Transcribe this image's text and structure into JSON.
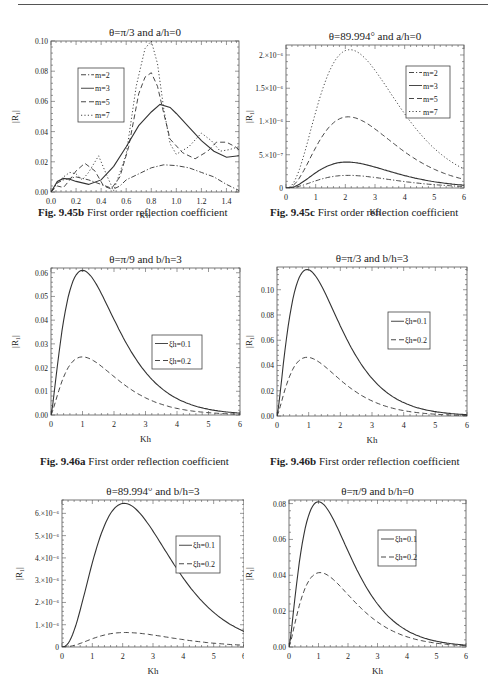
{
  "page": {
    "captions": [
      {
        "id": "9.45b",
        "bold": "Fig. 9.45b",
        "text": " First order reflection coefficient"
      },
      {
        "id": "9.45c",
        "bold": "Fig. 9.45c",
        "text": " First order reflection coefficient"
      },
      {
        "id": "9.46a",
        "bold": "Fig. 9.46a",
        "text": " First order reflection coefficient"
      },
      {
        "id": "9.46b",
        "bold": "Fig. 9.46b",
        "text": " First order reflection coefficient"
      }
    ]
  },
  "chart_data": [
    {
      "id": "fig-9-45b",
      "type": "line",
      "title": "θ=π/3 and a/h=0",
      "xlabel": "Kh",
      "ylabel": "|R₁|",
      "xlim": [
        0,
        1.5
      ],
      "ylim": [
        0,
        0.1
      ],
      "xticks": [
        0.0,
        0.2,
        0.4,
        0.6,
        0.8,
        1.0,
        1.2,
        1.4
      ],
      "xtick_labels": [
        "0.0",
        "0.2",
        "0.4",
        "0.6",
        "0.8",
        "1.0",
        "1.2",
        "1.4"
      ],
      "yticks": [
        0,
        0.02,
        0.04,
        0.06,
        0.08,
        0.1
      ],
      "ytick_labels": [
        "0.00",
        "0.02",
        "0.04",
        "0.06",
        "0.08",
        "0.10"
      ],
      "legend_position": "upper left",
      "series": [
        {
          "name": "m=2",
          "style": "dashdot",
          "x": [
            0,
            0.05,
            0.1,
            0.15,
            0.2,
            0.3,
            0.4,
            0.5,
            0.55,
            0.6,
            0.7,
            0.8,
            0.9,
            1.0,
            1.1,
            1.2,
            1.3,
            1.4,
            1.5
          ],
          "y": [
            0,
            0.006,
            0.008,
            0.009,
            0.01,
            0.008,
            0.005,
            0.002,
            0.004,
            0.008,
            0.012,
            0.016,
            0.018,
            0.0175,
            0.016,
            0.013,
            0.01,
            0.005,
            0.001
          ]
        },
        {
          "name": "m=3",
          "style": "solid",
          "x": [
            0,
            0.05,
            0.1,
            0.15,
            0.2,
            0.3,
            0.4,
            0.5,
            0.6,
            0.7,
            0.8,
            0.87,
            0.95,
            1.0,
            1.1,
            1.2,
            1.3,
            1.4,
            1.5
          ],
          "y": [
            0,
            0.007,
            0.009,
            0.0085,
            0.007,
            0.005,
            0.008,
            0.017,
            0.03,
            0.044,
            0.053,
            0.058,
            0.056,
            0.052,
            0.043,
            0.034,
            0.027,
            0.023,
            0.024
          ]
        },
        {
          "name": "m=5",
          "style": "dashed",
          "x": [
            0,
            0.05,
            0.1,
            0.15,
            0.2,
            0.27,
            0.35,
            0.42,
            0.48,
            0.55,
            0.62,
            0.7,
            0.75,
            0.8,
            0.85,
            0.9,
            0.95,
            1.05,
            1.15,
            1.25,
            1.32,
            1.4,
            1.47,
            1.5
          ],
          "y": [
            0,
            0.004,
            0.003,
            0.008,
            0.014,
            0.019,
            0.014,
            0.004,
            0.002,
            0.01,
            0.03,
            0.065,
            0.076,
            0.079,
            0.07,
            0.052,
            0.035,
            0.026,
            0.022,
            0.027,
            0.033,
            0.033,
            0.03,
            0.028
          ]
        },
        {
          "name": "m=7",
          "style": "dotted",
          "x": [
            0,
            0.05,
            0.1,
            0.15,
            0.2,
            0.25,
            0.3,
            0.38,
            0.45,
            0.5,
            0.6,
            0.68,
            0.75,
            0.8,
            0.85,
            0.9,
            0.95,
            1.0,
            1.1,
            1.2,
            1.28,
            1.35,
            1.42,
            1.5
          ],
          "y": [
            0,
            0.006,
            0.01,
            0.013,
            0.012,
            0.008,
            0.013,
            0.024,
            0.01,
            0.001,
            0.025,
            0.07,
            0.095,
            0.1,
            0.085,
            0.055,
            0.032,
            0.025,
            0.03,
            0.039,
            0.034,
            0.027,
            0.028,
            0.03
          ]
        }
      ]
    },
    {
      "id": "fig-9-45c",
      "type": "line",
      "title": "θ=89.994° and a/h=0",
      "xlabel": "Kh",
      "ylabel": "|R₁|",
      "xlim": [
        0,
        6
      ],
      "ylim": [
        0,
        2.15e-06
      ],
      "xticks": [
        0,
        1,
        2,
        3,
        4,
        5,
        6
      ],
      "xtick_labels": [
        "0",
        "1",
        "2",
        "3",
        "4",
        "5",
        "6"
      ],
      "yticks": [
        0,
        5e-07,
        1e-06,
        1.5e-06,
        2e-06
      ],
      "ytick_labels": [
        "0",
        "5.×10⁻⁷",
        "1.×10⁻⁶",
        "1.5×10⁻⁶",
        "2.×10⁻⁶"
      ],
      "legend_position": "upper right",
      "series": [
        {
          "name": "m=2",
          "style": "dashdot",
          "peak_x": 2.1,
          "peak_y": 1.9e-07
        },
        {
          "name": "m=3",
          "style": "solid",
          "peak_x": 2.05,
          "peak_y": 3.9e-07
        },
        {
          "name": "m=5",
          "style": "dashed",
          "peak_x": 2.1,
          "peak_y": 1.07e-06
        },
        {
          "name": "m=7",
          "style": "dotted",
          "peak_x": 2.15,
          "peak_y": 2.08e-06
        }
      ]
    },
    {
      "id": "fig-9-46a",
      "type": "line",
      "title": "θ=π/9 and b/h=3",
      "xlabel": "Kh",
      "ylabel": "|R₁|",
      "xlim": [
        0,
        6
      ],
      "ylim": [
        0,
        0.062
      ],
      "xticks": [
        0,
        1,
        2,
        3,
        4,
        5,
        6
      ],
      "xtick_labels": [
        "0",
        "1",
        "2",
        "3",
        "4",
        "5",
        "6"
      ],
      "yticks": [
        0,
        0.01,
        0.02,
        0.03,
        0.04,
        0.05,
        0.06
      ],
      "ytick_labels": [
        "0.00",
        "0.01",
        "0.02",
        "0.03",
        "0.04",
        "0.05",
        "0.06"
      ],
      "legend_position": "center right",
      "series": [
        {
          "name": "ξh=0.1",
          "style": "solid",
          "peak_x": 1.0,
          "peak_y": 0.061
        },
        {
          "name": "ξh=0.2",
          "style": "dashed",
          "peak_x": 1.0,
          "peak_y": 0.0245
        }
      ]
    },
    {
      "id": "fig-9-46b",
      "type": "line",
      "title": "θ=π/3 and b/h=3",
      "xlabel": "Kh",
      "ylabel": "|R₁|",
      "xlim": [
        0,
        6
      ],
      "ylim": [
        0,
        0.118
      ],
      "xticks": [
        0,
        1,
        2,
        3,
        4,
        5,
        6
      ],
      "xtick_labels": [
        "0",
        "1",
        "2",
        "3",
        "4",
        "5",
        "6"
      ],
      "yticks": [
        0,
        0.02,
        0.04,
        0.06,
        0.08,
        0.1
      ],
      "ytick_labels": [
        "0.00",
        "0.02",
        "0.04",
        "0.06",
        "0.08",
        "0.10"
      ],
      "legend_position": "upper right",
      "series": [
        {
          "name": "ξh=0.1",
          "style": "solid",
          "peak_x": 0.95,
          "peak_y": 0.116
        },
        {
          "name": "ξh=0.2",
          "style": "dashed",
          "peak_x": 0.95,
          "peak_y": 0.0465
        }
      ]
    },
    {
      "id": "fig-9-46c",
      "type": "line",
      "title": "θ=89.994° and b/h=3",
      "xlabel": "Kh",
      "ylabel": "|R₁|",
      "xlim": [
        0,
        6
      ],
      "ylim": [
        0,
        6.6e-06
      ],
      "xticks": [
        0,
        1,
        2,
        3,
        4,
        5,
        6
      ],
      "xtick_labels": [
        "0",
        "1",
        "2",
        "3",
        "4",
        "5",
        "6"
      ],
      "yticks": [
        0,
        1e-06,
        2e-06,
        3e-06,
        4e-06,
        5e-06,
        6e-06
      ],
      "ytick_labels": [
        "0",
        "1.×10⁻⁶",
        "2.×10⁻⁶",
        "3.×10⁻⁶",
        "4.×10⁻⁶",
        "5.×10⁻⁶",
        "6.×10⁻⁶"
      ],
      "legend_position": "upper right",
      "series": [
        {
          "name": "ξh=0.1",
          "style": "solid",
          "peak_x": 2.05,
          "peak_y": 6.45e-06
        },
        {
          "name": "ξh=0.2",
          "style": "dashed",
          "peak_x": 2.1,
          "peak_y": 6.5e-07
        }
      ]
    },
    {
      "id": "fig-9-46d",
      "type": "line",
      "title": "θ=π/9 and b/h=0",
      "xlabel": "Kh",
      "ylabel": "|R₁|",
      "xlim": [
        0,
        6
      ],
      "ylim": [
        0,
        0.082
      ],
      "xticks": [
        0,
        1,
        2,
        3,
        4,
        5,
        6
      ],
      "xtick_labels": [
        "0",
        "1",
        "2",
        "3",
        "4",
        "5",
        "6"
      ],
      "yticks": [
        0,
        0.02,
        0.04,
        0.06,
        0.08
      ],
      "ytick_labels": [
        "0.00",
        "0.02",
        "0.04",
        "0.06",
        "0.08"
      ],
      "legend_position": "upper right",
      "series": [
        {
          "name": "ξh=0.1",
          "style": "solid",
          "peak_x": 1.0,
          "peak_y": 0.081
        },
        {
          "name": "ξh=0.2",
          "style": "dashed",
          "peak_x": 1.05,
          "peak_y": 0.0415
        }
      ]
    }
  ],
  "layout": [
    {
      "chart": 0,
      "fig_left": 0,
      "fig_top": 8,
      "w": 244,
      "h": 210,
      "plot": [
        51,
        33,
        188,
        151
      ],
      "legend": [
        78,
        60,
        46,
        54
      ],
      "ylabel_x": 18,
      "caption": 0,
      "caption_pos": [
        38,
        206
      ]
    },
    {
      "chart": 1,
      "fig_left": 244,
      "fig_top": 8,
      "w": 244,
      "h": 210,
      "plot": [
        42,
        37,
        178,
        143
      ],
      "legend": [
        162,
        58,
        44,
        52
      ],
      "ylabel_x": 8,
      "caption": 1,
      "caption_pos": [
        270,
        206
      ]
    },
    {
      "chart": 2,
      "fig_left": 0,
      "fig_top": 255,
      "w": 244,
      "h": 200,
      "plot": [
        51,
        13,
        189,
        147
      ],
      "legend": [
        152,
        80,
        50,
        34
      ],
      "ylabel_x": 18,
      "caption": 2,
      "caption_pos": [
        40,
        455
      ]
    },
    {
      "chart": 3,
      "fig_left": 244,
      "fig_top": 255,
      "w": 244,
      "h": 200,
      "plot": [
        33,
        12,
        190,
        149
      ],
      "legend": [
        144,
        57,
        42,
        37
      ],
      "ylabel_x": 8,
      "caption": 3,
      "caption_pos": [
        270,
        455
      ]
    },
    {
      "chart": 4,
      "fig_left": 0,
      "fig_top": 488,
      "w": 244,
      "h": 187,
      "plot": [
        62,
        12,
        182,
        147
      ],
      "legend": [
        176,
        48,
        44,
        37
      ],
      "ylabel_x": 22,
      "caption": null
    },
    {
      "chart": 5,
      "fig_left": 244,
      "fig_top": 488,
      "w": 244,
      "h": 187,
      "plot": [
        45,
        12,
        177,
        147
      ],
      "legend": [
        134,
        42,
        38,
        36
      ],
      "ylabel_x": 8,
      "caption": null
    }
  ]
}
